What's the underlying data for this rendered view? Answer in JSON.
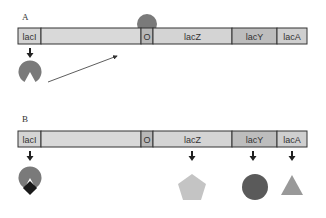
{
  "panels": {
    "A": {
      "label": "A",
      "genes": [
        {
          "name": "lacI",
          "x": 18,
          "w": 23,
          "fill": "#d4d4d4"
        },
        {
          "name": "",
          "x": 41,
          "w": 100,
          "fill": "#d9d9d9"
        },
        {
          "name": "O",
          "x": 141,
          "w": 12,
          "fill": "#b8b8b8"
        },
        {
          "name": "lacZ",
          "x": 153,
          "w": 79,
          "fill": "#d4d4d4"
        },
        {
          "name": "lacY",
          "x": 232,
          "w": 45,
          "fill": "#bdbdbd"
        },
        {
          "name": "lacA",
          "x": 277,
          "w": 30,
          "fill": "#cfcfcf"
        }
      ],
      "description": "Repressor produced by lacI binds operator O"
    },
    "B": {
      "label": "B",
      "genes": [
        {
          "name": "lacI"
        },
        {
          "name": ""
        },
        {
          "name": "O"
        },
        {
          "name": "lacZ"
        },
        {
          "name": "lacY"
        },
        {
          "name": "lacA"
        }
      ],
      "products": [
        {
          "gene": "lacI",
          "shape": "repressor-with-inducer"
        },
        {
          "gene": "lacZ",
          "shape": "pentagon"
        },
        {
          "gene": "lacY",
          "shape": "circle"
        },
        {
          "gene": "lacA",
          "shape": "triangle"
        }
      ],
      "description": "Inducer binds repressor; structural genes expressed"
    }
  },
  "colors": {
    "outline": "#333333",
    "repressor": "#7a7a7a",
    "inducer": "#1a1a1a",
    "pentagon": "#c4c4c4",
    "circle": "#5a5a5a",
    "triangle": "#999999",
    "arrow": "#333333"
  }
}
